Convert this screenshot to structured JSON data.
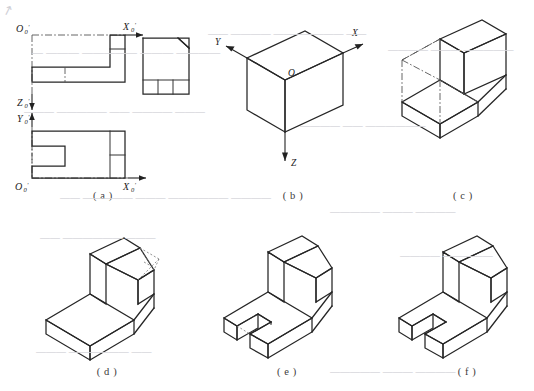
{
  "figure": {
    "sheet_width": 534,
    "sheet_height": 391,
    "background_color": "#ffffff",
    "line_color": "#262626",
    "hidden_line_color": "#4a4a4a",
    "caption_color": "#3a3a3a",
    "corner_mark": "↗"
  },
  "panels": [
    {
      "id": "a",
      "caption": "( a )",
      "kind": "orthographic-views",
      "description": "Three orthographic views of the part with coordinate origin axes marked",
      "axis_labels": [
        {
          "name": "O0-prime-front",
          "base": "O",
          "sub": "0",
          "prime": "′",
          "view": "front-view"
        },
        {
          "name": "X0-prime-front",
          "base": "X",
          "sub": "0",
          "prime": "′",
          "view": "front-view"
        },
        {
          "name": "Z0-prime-front",
          "base": "Z",
          "sub": "0",
          "prime": "′",
          "view": "front-view"
        },
        {
          "name": "Y0-prime-top",
          "base": "Y",
          "sub": "0",
          "prime": "′",
          "view": "top-view"
        },
        {
          "name": "O0-prime-top",
          "base": "O",
          "sub": "0",
          "prime": "′",
          "view": "top-view"
        },
        {
          "name": "X0-prime-top",
          "base": "X",
          "sub": "0",
          "prime": "′",
          "view": "top-view"
        }
      ],
      "views": [
        {
          "name": "front-view",
          "shape": "L-shaped profile with raised right boss"
        },
        {
          "name": "side-view",
          "shape": "square with chamfered top-right corner and three-cell base band"
        },
        {
          "name": "top-view",
          "shape": "rectangle with left slot notch and right end divisions"
        }
      ]
    },
    {
      "id": "b",
      "caption": "( b )",
      "kind": "isometric-axes-box",
      "description": "Isometric bounding box with X, Y, Z axes radiating from origin O",
      "axis_labels": [
        {
          "name": "axis-label-y",
          "text": "Y"
        },
        {
          "name": "axis-label-o",
          "text": "O"
        },
        {
          "name": "axis-label-x",
          "text": "X"
        },
        {
          "name": "axis-label-z",
          "text": "Z"
        }
      ]
    },
    {
      "id": "c",
      "caption": "( c )",
      "kind": "isometric-wireframe",
      "description": "L-shaped block blocked out inside the bounding box with hidden construction lines"
    },
    {
      "id": "d",
      "caption": "( d )",
      "kind": "isometric-solid-chamfer",
      "description": "Solid L-block with the chamfer laid out on the upright wall using construction lines"
    },
    {
      "id": "e",
      "caption": "( e )",
      "kind": "isometric-solid-slot",
      "description": "Chamfer completed and the slot cut through the base plate"
    },
    {
      "id": "f",
      "caption": "( f )",
      "kind": "isometric-solid-final",
      "description": "Finished isometric pictorial with construction lines removed"
    }
  ],
  "bleed_text": [
    {
      "text": "— ———  —————  ———  ————",
      "x": 32,
      "y": 46,
      "size": 11
    },
    {
      "text": "——  ————  ———————  ——",
      "x": 208,
      "y": 28,
      "size": 10
    },
    {
      "text": "————  ———  —————",
      "x": 388,
      "y": 44,
      "size": 10
    },
    {
      "text": "———  —————  ——  ————  ———",
      "x": 24,
      "y": 106,
      "size": 10
    },
    {
      "text": "————  ——  ——————",
      "x": 300,
      "y": 120,
      "size": 10
    },
    {
      "text": "——  —————  ———  ——————  ————",
      "x": 60,
      "y": 192,
      "size": 10
    },
    {
      "text": "—————  ———  ————",
      "x": 330,
      "y": 206,
      "size": 10
    },
    {
      "text": "——  ——————  ———",
      "x": 40,
      "y": 232,
      "size": 10
    },
    {
      "text": "————  —————",
      "x": 400,
      "y": 250,
      "size": 10
    },
    {
      "text": "———  ——————  ——",
      "x": 36,
      "y": 346,
      "size": 10
    },
    {
      "text": "—————  ———  ————",
      "x": 330,
      "y": 366,
      "size": 10
    }
  ]
}
